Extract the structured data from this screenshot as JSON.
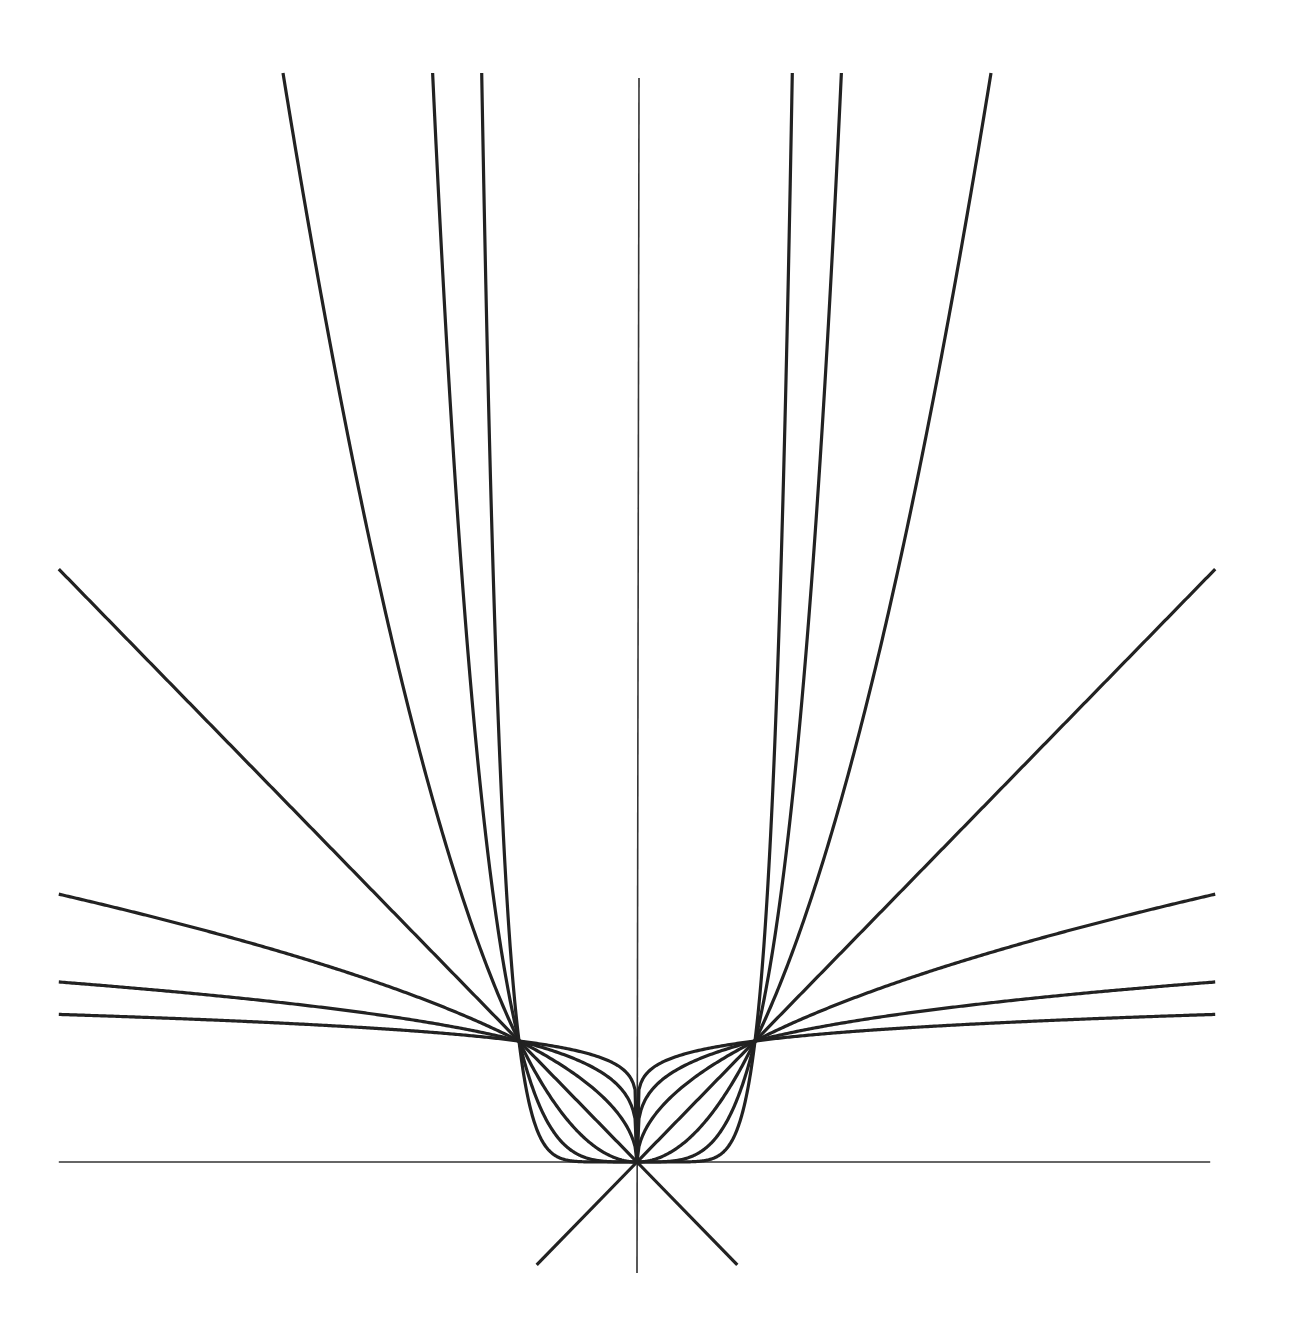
{
  "page": {
    "header_text_cropped": ""
  },
  "chart_data": {
    "type": "line",
    "title": "",
    "xlabel": "",
    "ylabel": "",
    "xlim": [
      -4.9,
      4.9
    ],
    "ylim": [
      -0.9,
      9
    ],
    "grid": false,
    "legend": null,
    "axes": {
      "x_axis": true,
      "y_axis": true,
      "ticks": false
    },
    "series": [
      {
        "name": "y = |x|^(1/8)",
        "exponent": 0.125
      },
      {
        "name": "y = |x|^(1/4)",
        "exponent": 0.25
      },
      {
        "name": "y = |x|^(1/2)",
        "exponent": 0.5
      },
      {
        "name": "y = |x|",
        "exponent": 1
      },
      {
        "name": "y = |x|^2",
        "exponent": 2
      },
      {
        "name": "y = |x|^4",
        "exponent": 4
      },
      {
        "name": "y = |x|^8",
        "exponent": 8
      }
    ],
    "extra_lines": [
      {
        "name": "y = x (extended below origin)",
        "from": [
          -0.85,
          -0.85
        ],
        "to": [
          0,
          0
        ]
      },
      {
        "name": "y = -x (extended below origin)",
        "from": [
          0.85,
          -0.85
        ],
        "to": [
          0,
          0
        ]
      }
    ],
    "common_points": [
      [
        -1,
        1
      ],
      [
        0,
        0
      ],
      [
        1,
        1
      ]
    ],
    "pixel_mapping": {
      "origin": [
        637,
        1162
      ],
      "x_unit_px": 118,
      "y_unit_px": 121
    },
    "line_color": "#222222",
    "axis_color": "#333333"
  }
}
